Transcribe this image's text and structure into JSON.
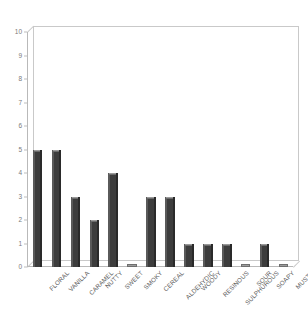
{
  "chart_data": {
    "type": "bar",
    "title": "",
    "subtitle": "",
    "xlabel": "",
    "ylabel": "",
    "categories": [
      "FLORAL",
      "VANILLA",
      "CARAMEL",
      "NUTTY",
      "SWEET",
      "SMOKY",
      "CEREAL",
      "ALDEHYDIC",
      "WOODY",
      "RESINOUS",
      "SULPHUROUS",
      "SOUR",
      "SOAPY",
      "MUSTY"
    ],
    "values": [
      5,
      5,
      3,
      2,
      4,
      0,
      3,
      3,
      1,
      1,
      1,
      0,
      1,
      0
    ],
    "ylim": [
      0,
      10
    ],
    "ytick_labels": [
      "0",
      "1",
      "2",
      "3",
      "4",
      "5",
      "6",
      "7",
      "8",
      "9",
      "10"
    ],
    "ytick_values": [
      0,
      1,
      2,
      3,
      4,
      5,
      6,
      7,
      8,
      9,
      10
    ],
    "grid": false,
    "legend": null,
    "bar_color": "#3d3d3d",
    "axis_color": "#bdbdbd",
    "background_color": "#ffffff",
    "label_rotation_deg": -45,
    "style": "3d-column"
  }
}
